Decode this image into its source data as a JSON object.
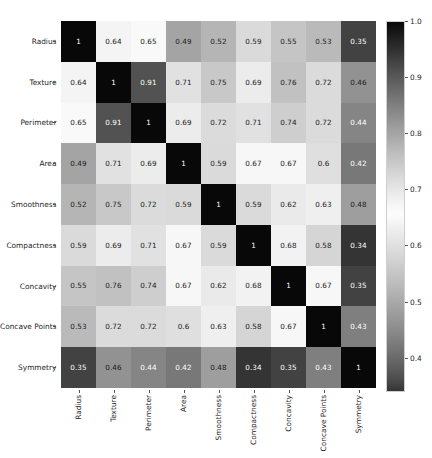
{
  "chart_data": {
    "type": "heatmap",
    "title": "",
    "xlabel": "",
    "ylabel": "",
    "grid": false,
    "legend_position": "right",
    "colormap": "gray-diverging (1.0 dark, 0.65 light, 0.34 dark)",
    "colorbar": {
      "ticks": [
        "1.0",
        "0.9",
        "0.8",
        "0.7",
        "0.6",
        "0.5",
        "0.4"
      ],
      "tick_values": [
        1.0,
        0.9,
        0.8,
        0.7,
        0.6,
        0.5,
        0.4
      ],
      "vmin": 0.34,
      "vmax": 1.0
    },
    "categories": [
      "Radius",
      "Texture",
      "Perimeter",
      "Area",
      "Smoothness",
      "Compactness",
      "Concavity",
      "Concave Points",
      "Symmetry"
    ],
    "x_tick_labels": [
      "Radius",
      "Texture",
      "Perimeter",
      "Area",
      "Smoothness",
      "Compactness",
      "Concavity",
      "Concave Points",
      "Symmetry"
    ],
    "y_tick_labels": [
      "Radius",
      "Texture",
      "Perimeter",
      "Area",
      "Smoothness",
      "Compactness",
      "Concavity",
      "Concave Points",
      "Symmetry"
    ],
    "values": [
      [
        1.0,
        0.64,
        0.65,
        0.49,
        0.52,
        0.59,
        0.55,
        0.53,
        0.35
      ],
      [
        0.64,
        1.0,
        0.91,
        0.71,
        0.75,
        0.69,
        0.76,
        0.72,
        0.46
      ],
      [
        0.65,
        0.91,
        1.0,
        0.69,
        0.72,
        0.71,
        0.74,
        0.72,
        0.44
      ],
      [
        0.49,
        0.71,
        0.69,
        1.0,
        0.59,
        0.67,
        0.67,
        0.6,
        0.42
      ],
      [
        0.52,
        0.75,
        0.72,
        0.59,
        1.0,
        0.59,
        0.62,
        0.63,
        0.48
      ],
      [
        0.59,
        0.69,
        0.71,
        0.67,
        0.59,
        1.0,
        0.68,
        0.58,
        0.34
      ],
      [
        0.55,
        0.76,
        0.74,
        0.67,
        0.62,
        0.68,
        1.0,
        0.67,
        0.35
      ],
      [
        0.53,
        0.72,
        0.72,
        0.6,
        0.63,
        0.58,
        0.67,
        1.0,
        0.43
      ],
      [
        0.35,
        0.46,
        0.44,
        0.42,
        0.48,
        0.34,
        0.35,
        0.43,
        1.0
      ]
    ],
    "cell_labels": [
      [
        "1",
        "0.64",
        "0.65",
        "0.49",
        "0.52",
        "0.59",
        "0.55",
        "0.53",
        "0.35"
      ],
      [
        "0.64",
        "1",
        "0.91",
        "0.71",
        "0.75",
        "0.69",
        "0.76",
        "0.72",
        "0.46"
      ],
      [
        "0.65",
        "0.91",
        "1",
        "0.69",
        "0.72",
        "0.71",
        "0.74",
        "0.72",
        "0.44"
      ],
      [
        "0.49",
        "0.71",
        "0.69",
        "1",
        "0.59",
        "0.67",
        "0.67",
        "0.6",
        "0.42"
      ],
      [
        "0.52",
        "0.75",
        "0.72",
        "0.59",
        "1",
        "0.59",
        "0.62",
        "0.63",
        "0.48"
      ],
      [
        "0.59",
        "0.69",
        "0.71",
        "0.67",
        "0.59",
        "1",
        "0.68",
        "0.58",
        "0.34"
      ],
      [
        "0.55",
        "0.76",
        "0.74",
        "0.67",
        "0.62",
        "0.68",
        "1",
        "0.67",
        "0.35"
      ],
      [
        "0.53",
        "0.72",
        "0.72",
        "0.6",
        "0.63",
        "0.58",
        "0.67",
        "1",
        "0.43"
      ],
      [
        "0.35",
        "0.46",
        "0.44",
        "0.42",
        "0.48",
        "0.34",
        "0.35",
        "0.43",
        "1"
      ]
    ]
  },
  "colors": {
    "background": "#ffffff",
    "text": "#262626",
    "tick": "#555555",
    "cell_text_light": "#ffffff",
    "cell_text_dark": "#1a1a1a"
  }
}
